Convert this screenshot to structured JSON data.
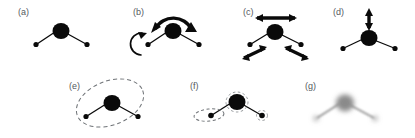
{
  "figure": {
    "width": 415,
    "height": 138,
    "background": "#ffffff",
    "ink": "#0a0a0a",
    "label_color": "#555a5e",
    "guide_color": "#6e7276",
    "blur_color": "#9a9a9a"
  },
  "panels": [
    {
      "id": "a",
      "label": "(a)",
      "annotation": "none",
      "caption": "static bent triatomic molecule"
    },
    {
      "id": "b",
      "label": "(b)",
      "annotation": "curved-rotation-arrows",
      "caption": "curved arc arrow over central atom and curved arrow at left outer atom"
    },
    {
      "id": "c",
      "label": "(c)",
      "annotation": "double-headed-straight-arrows",
      "caption": "horizontal double arrow above centre, two diagonal double arrows below outer atoms"
    },
    {
      "id": "d",
      "label": "(d)",
      "annotation": "vertical-double-arrow",
      "caption": "vertical double-headed arrow above central atom"
    },
    {
      "id": "e",
      "label": "(e)",
      "annotation": "large-dashed-ellipse",
      "caption": "tilted dashed ellipse enclosing the central and left atoms"
    },
    {
      "id": "f",
      "label": "(f)",
      "annotation": "small-dashed-ellipses",
      "caption": "small dashed ellipses around the individual atoms"
    },
    {
      "id": "g",
      "label": "(g)",
      "annotation": "blurred-molecule",
      "caption": "blurred grey rendering of the molecule"
    }
  ]
}
